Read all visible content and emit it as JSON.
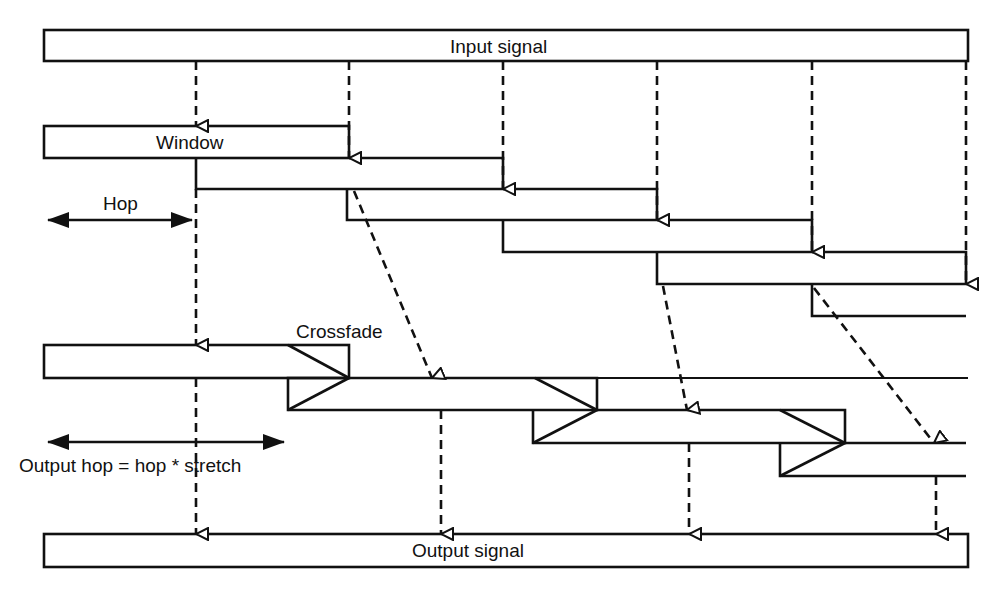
{
  "labels": {
    "input_signal": "Input signal",
    "window": "Window",
    "hop": "Hop",
    "crossfade": "Crossfade",
    "output_hop": "Output hop = hop * stretch",
    "output_signal": "Output signal"
  },
  "colors": {
    "stroke": "#111111",
    "background": "#ffffff"
  },
  "diagram": {
    "type": "time-stretch overlap-add (WSOLA/SOLA) schematic",
    "input_signal_bar": {
      "x": 44,
      "y": 30,
      "w": 924,
      "h": 31
    },
    "analysis_windows": [
      {
        "x": 44,
        "y": 126,
        "w": 305,
        "h": 32
      },
      {
        "x": 196,
        "y": 158,
        "w": 307,
        "h": 31
      },
      {
        "x": 347,
        "y": 189,
        "w": 310,
        "h": 31
      },
      {
        "x": 503,
        "y": 220,
        "w": 309,
        "h": 32
      },
      {
        "x": 657,
        "y": 252,
        "w": 309,
        "h": 32
      },
      {
        "x": 812,
        "y": 284,
        "w": 154,
        "h": 32
      }
    ],
    "input_hop_positions_x": [
      196,
      349,
      503,
      657,
      812,
      966
    ],
    "output_windows": [
      {
        "x": 44,
        "y": 345,
        "w": 305,
        "h": 33
      },
      {
        "x": 288,
        "y": 378,
        "w": 309,
        "h": 32
      },
      {
        "x": 533,
        "y": 410,
        "w": 312,
        "h": 33
      },
      {
        "x": 780,
        "y": 443,
        "w": 186,
        "h": 33
      }
    ],
    "output_signal_bar": {
      "x": 44,
      "y": 534,
      "w": 924,
      "h": 33
    },
    "output_hop_positions_x": [
      196,
      441,
      689,
      936
    ],
    "hop_arrow": {
      "x1": 46,
      "x2": 194,
      "y": 220
    },
    "output_hop_arrow": {
      "x1": 46,
      "x2": 286,
      "y": 442
    }
  }
}
